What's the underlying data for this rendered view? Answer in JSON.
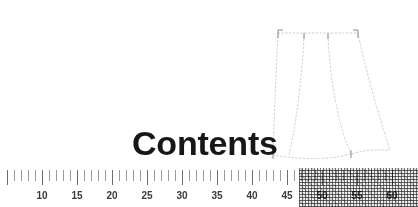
{
  "page": {
    "title": "Contents",
    "background_color": "#ffffff"
  },
  "illustration": {
    "name": "skirt-sewing-pattern",
    "description": "dotted outline skirt pattern with flared panels",
    "line_color": "#cfcfcf",
    "line_style": "dotted"
  },
  "ruler": {
    "unit_label": "",
    "tick_color": "#8e8e8e",
    "major_tick_color": "#6d6d6d",
    "label_color": "#3a3a3a",
    "minor_interval": 1,
    "major_interval": 5,
    "pixels_per_unit": 7,
    "origin_value": 5,
    "origin_x": 7,
    "min_value": 5,
    "max_value": 60,
    "labels": [
      {
        "value": 10,
        "text": "10",
        "x": 42
      },
      {
        "value": 15,
        "text": "15",
        "x": 77
      },
      {
        "value": 20,
        "text": "20",
        "x": 112
      },
      {
        "value": 25,
        "text": "25",
        "x": 147
      },
      {
        "value": 30,
        "text": "30",
        "x": 182
      },
      {
        "value": 35,
        "text": "35",
        "x": 217
      },
      {
        "value": 40,
        "text": "40",
        "x": 252
      },
      {
        "value": 45,
        "text": "45",
        "x": 287
      },
      {
        "value": 50,
        "text": "50",
        "x": 322
      },
      {
        "value": 55,
        "text": "55",
        "x": 357
      },
      {
        "value": 60,
        "text": "60",
        "x": 392
      }
    ],
    "texture_overlay": {
      "name": "halftone-dither",
      "start_x": 299,
      "end_x": 418,
      "color": "#3a3a3a"
    }
  }
}
